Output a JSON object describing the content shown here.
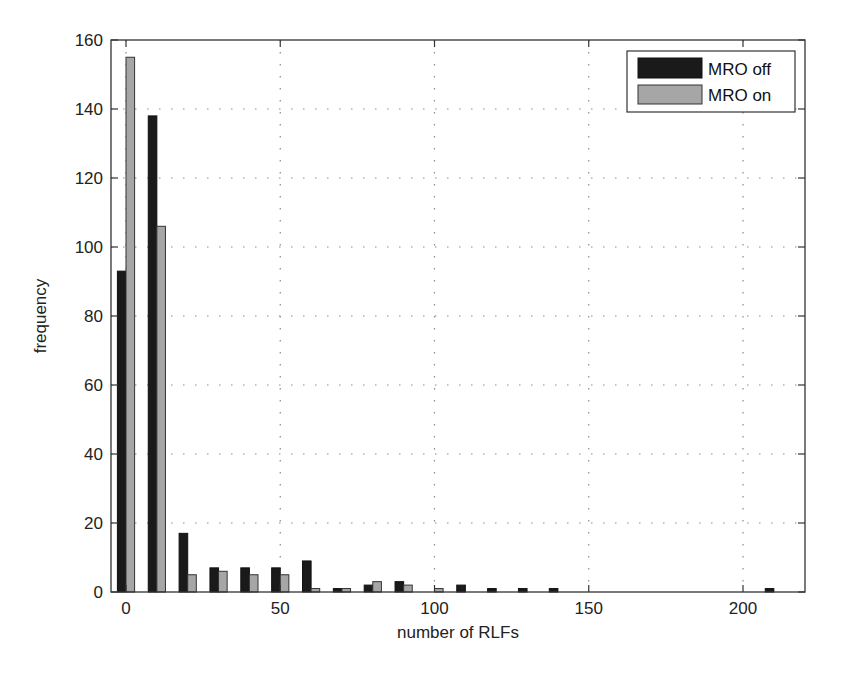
{
  "chart_data": {
    "type": "bar",
    "title": "",
    "xlabel": "number of RLFs",
    "ylabel": "frequency",
    "xlim": [
      -5,
      220
    ],
    "ylim": [
      0,
      160
    ],
    "xticks": [
      0,
      50,
      100,
      150,
      200
    ],
    "yticks": [
      0,
      20,
      40,
      60,
      80,
      100,
      120,
      140,
      160
    ],
    "grid": true,
    "legend_position": "upper right",
    "categories": [
      0,
      10,
      20,
      30,
      40,
      50,
      60,
      70,
      80,
      90,
      100,
      110,
      120,
      130,
      140,
      150,
      160,
      170,
      180,
      190,
      200,
      210
    ],
    "series": [
      {
        "name": "MRO off",
        "color": "#1a1a1a",
        "values": [
          93,
          138,
          17,
          7,
          7,
          7,
          9,
          1,
          2,
          3,
          0,
          2,
          1,
          1,
          1,
          0,
          0,
          0,
          0,
          0,
          0,
          1
        ]
      },
      {
        "name": "MRO on",
        "color": "#a6a6a6",
        "values": [
          155,
          106,
          5,
          6,
          5,
          5,
          1,
          1,
          3,
          2,
          1,
          0,
          0,
          0,
          0,
          0,
          0,
          0,
          0,
          0,
          0,
          0
        ]
      }
    ]
  },
  "legend": {
    "items": [
      {
        "label": "MRO off",
        "color": "#1a1a1a"
      },
      {
        "label": "MRO on",
        "color": "#a6a6a6"
      }
    ]
  },
  "axes": {
    "xlabel": "number of RLFs",
    "ylabel": "frequency"
  }
}
